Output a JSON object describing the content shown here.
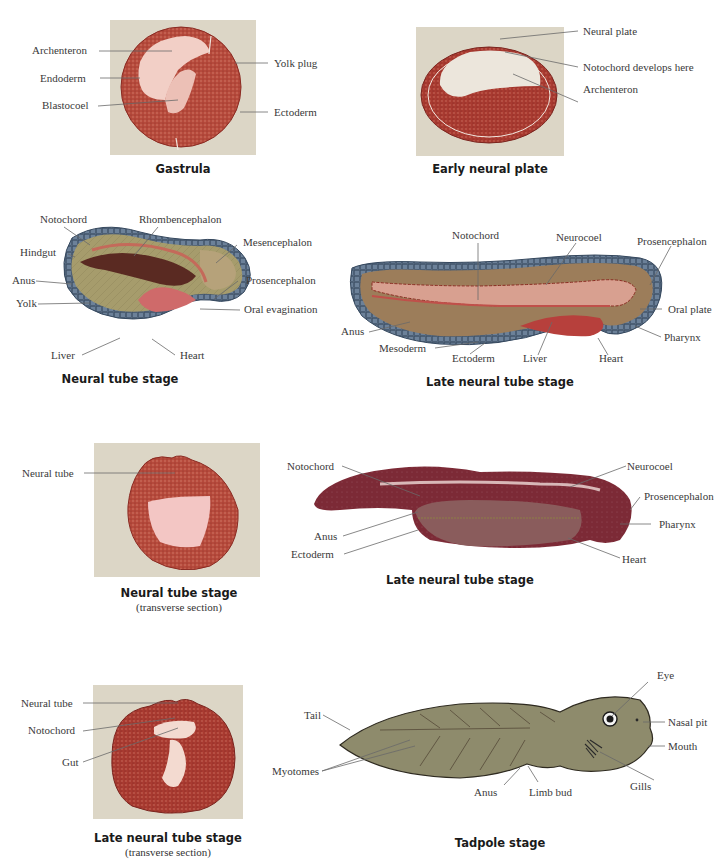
{
  "panels": {
    "gastrula": {
      "caption": "Gastrula",
      "labels": {
        "archenteron": "Archenteron",
        "endoderm": "Endoderm",
        "blastocoel": "Blastocoel",
        "yolk_plug": "Yolk plug",
        "ectoderm": "Ectoderm"
      }
    },
    "early_neural_plate": {
      "caption": "Early neural plate",
      "labels": {
        "neural_plate": "Neural plate",
        "notochord": "Notochord develops here",
        "archenteron": "Archenteron"
      }
    },
    "neural_tube_stage": {
      "caption": "Neural tube stage",
      "labels": {
        "notochord": "Notochord",
        "rhombencephalon": "Rhombencephalon",
        "hindgut": "Hindgut",
        "mesencephalon": "Mesencephalon",
        "anus": "Anus",
        "prosencephalon": "Prosencephalon",
        "yolk": "Yolk",
        "oral_evagination": "Oral evagination",
        "liver": "Liver",
        "heart": "Heart"
      }
    },
    "late_neural_tube_stage_1": {
      "caption": "Late neural tube stage",
      "labels": {
        "notochord": "Notochord",
        "neurocoel": "Neurocoel",
        "prosencephalon": "Prosencephalon",
        "oral_plate": "Oral plate",
        "anus": "Anus",
        "pharynx": "Pharynx",
        "mesoderm": "Mesoderm",
        "ectoderm": "Ectoderm",
        "liver": "Liver",
        "heart": "Heart"
      }
    },
    "neural_tube_transverse": {
      "caption": "Neural tube stage",
      "subcaption": "(transverse section)",
      "labels": {
        "neural_tube": "Neural tube"
      }
    },
    "late_neural_tube_stage_2": {
      "caption": "Late neural tube stage",
      "labels": {
        "notochord": "Notochord",
        "neurocoel": "Neurocoel",
        "prosencephalon": "Prosencephalon",
        "pharynx": "Pharynx",
        "anus": "Anus",
        "ectoderm": "Ectoderm",
        "heart": "Heart"
      }
    },
    "late_neural_tube_transverse": {
      "caption": "Late neural tube stage",
      "subcaption": "(transverse section)",
      "labels": {
        "neural_tube": "Neural tube",
        "notochord": "Notochord",
        "gut": "Gut"
      }
    },
    "tadpole_stage": {
      "caption": "Tadpole stage",
      "labels": {
        "eye": "Eye",
        "tail": "Tail",
        "nasal_pit": "Nasal pit",
        "mouth": "Mouth",
        "myotomes": "Myotomes",
        "anus": "Anus",
        "limb_bud": "Limb bud",
        "gills": "Gills"
      }
    }
  },
  "colors": {
    "photo_bg": "#dcd6c8",
    "stain_red": "#b8483a",
    "stain_pale": "#f0c8c0",
    "ectoderm_blue": "#6a7f96",
    "yolk_olive": "#a39a6a",
    "tissue_maroon": "#7a1e2c",
    "tadpole_olive": "#8c8a68"
  }
}
